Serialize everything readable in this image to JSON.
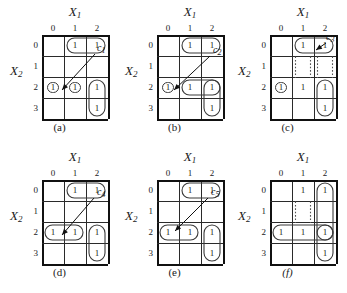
{
  "figure": {
    "axis_x_label": "X",
    "axis_x_sub": "1",
    "axis_y_label": "X",
    "axis_y_sub": "2",
    "column_ticks": [
      "0",
      "1",
      "2"
    ],
    "row_ticks": [
      "0",
      "1",
      "2",
      "3"
    ],
    "cell_value": "1",
    "grid_columns": 3,
    "grid_rows": 4,
    "ink_color": "#2a2a2a",
    "group_color": "#3a3a3a",
    "dotted_color": "#555555",
    "background": "#ffffff"
  },
  "panels": [
    {
      "id": "a",
      "caption": "(a)",
      "caption_italic": false,
      "annotation": {
        "label": "c",
        "sub": "1"
      },
      "ones": [
        [
          1,
          0
        ],
        [
          2,
          0
        ],
        [
          0,
          2
        ],
        [
          1,
          2
        ],
        [
          2,
          2
        ],
        [
          2,
          3
        ]
      ],
      "groups": [
        {
          "type": "ellipse-horizontal",
          "cells": [
            [
              1,
              0
            ],
            [
              2,
              0
            ]
          ]
        },
        {
          "type": "ellipse-single",
          "cells": [
            [
              0,
              2
            ]
          ]
        },
        {
          "type": "ellipse-single",
          "cells": [
            [
              1,
              2
            ]
          ]
        },
        {
          "type": "ellipse-vertical",
          "cells": [
            [
              2,
              2
            ],
            [
              2,
              3
            ]
          ]
        }
      ]
    },
    {
      "id": "b",
      "caption": "(b)",
      "caption_italic": false,
      "annotation": {
        "label": "c",
        "sub": "2"
      },
      "ones": [
        [
          1,
          0
        ],
        [
          2,
          0
        ],
        [
          0,
          2
        ],
        [
          1,
          2
        ],
        [
          2,
          2
        ],
        [
          2,
          3
        ]
      ],
      "groups": [
        {
          "type": "ellipse-horizontal",
          "cells": [
            [
              1,
              0
            ],
            [
              2,
              0
            ]
          ]
        },
        {
          "type": "ellipse-single",
          "cells": [
            [
              0,
              2
            ]
          ]
        },
        {
          "type": "ellipse-horizontal",
          "cells": [
            [
              1,
              2
            ],
            [
              2,
              2
            ]
          ]
        },
        {
          "type": "ellipse-vertical",
          "cells": [
            [
              2,
              2
            ],
            [
              2,
              3
            ]
          ]
        }
      ]
    },
    {
      "id": "c",
      "caption": "(c)",
      "caption_italic": false,
      "annotation": {
        "label": "c",
        "sub": "3"
      },
      "ones": [
        [
          1,
          0
        ],
        [
          2,
          0
        ],
        [
          0,
          2
        ],
        [
          1,
          2
        ],
        [
          2,
          2
        ],
        [
          2,
          3
        ]
      ],
      "groups": [
        {
          "type": "ellipse-horizontal",
          "cells": [
            [
              1,
              0
            ],
            [
              2,
              0
            ]
          ]
        },
        {
          "type": "ellipse-single",
          "cells": [
            [
              0,
              2
            ]
          ]
        },
        {
          "type": "ellipse-vertical",
          "cells": [
            [
              2,
              2
            ],
            [
              2,
              3
            ]
          ]
        },
        {
          "type": "dotted-wrap",
          "cells": [
            [
              1,
              0
            ],
            [
              2,
              0
            ],
            [
              1,
              2
            ],
            [
              2,
              2
            ]
          ]
        }
      ]
    },
    {
      "id": "d",
      "caption": "(d)",
      "caption_italic": false,
      "annotation": {
        "label": "c",
        "sub": "4"
      },
      "ones": [
        [
          1,
          0
        ],
        [
          2,
          0
        ],
        [
          0,
          2
        ],
        [
          1,
          2
        ],
        [
          2,
          2
        ],
        [
          2,
          3
        ]
      ],
      "groups": [
        {
          "type": "ellipse-horizontal",
          "cells": [
            [
              1,
              0
            ],
            [
              2,
              0
            ]
          ]
        },
        {
          "type": "ellipse-horizontal",
          "cells": [
            [
              0,
              2
            ],
            [
              1,
              2
            ]
          ]
        },
        {
          "type": "ellipse-vertical",
          "cells": [
            [
              2,
              2
            ],
            [
              2,
              3
            ]
          ]
        }
      ]
    },
    {
      "id": "e",
      "caption": "(e)",
      "caption_italic": false,
      "annotation": {
        "label": "c",
        "sub": "5"
      },
      "ones": [
        [
          1,
          0
        ],
        [
          2,
          0
        ],
        [
          0,
          2
        ],
        [
          1,
          2
        ],
        [
          2,
          2
        ],
        [
          2,
          3
        ]
      ],
      "groups": [
        {
          "type": "ellipse-horizontal",
          "cells": [
            [
              1,
              0
            ],
            [
              2,
              0
            ]
          ]
        },
        {
          "type": "ellipse-horizontal",
          "cells": [
            [
              0,
              2
            ],
            [
              1,
              2
            ]
          ]
        },
        {
          "type": "ellipse-vertical",
          "cells": [
            [
              2,
              2
            ],
            [
              2,
              3
            ]
          ]
        }
      ]
    },
    {
      "id": "f",
      "caption": "(f)",
      "caption_italic": true,
      "annotation": null,
      "ones": [
        [
          1,
          0
        ],
        [
          2,
          0
        ],
        [
          0,
          2
        ],
        [
          1,
          2
        ],
        [
          2,
          2
        ],
        [
          2,
          3
        ]
      ],
      "groups": [
        {
          "type": "ellipse-vertical",
          "cells": [
            [
              2,
              0
            ],
            [
              2,
              2
            ]
          ]
        },
        {
          "type": "ellipse-horizontal",
          "cells": [
            [
              0,
              2
            ],
            [
              1,
              2
            ],
            [
              2,
              2
            ]
          ]
        },
        {
          "type": "ellipse-vertical",
          "cells": [
            [
              2,
              2
            ],
            [
              2,
              3
            ]
          ]
        },
        {
          "type": "dotted-wrap",
          "cells": [
            [
              1,
              0
            ],
            [
              1,
              2
            ]
          ]
        }
      ]
    }
  ]
}
